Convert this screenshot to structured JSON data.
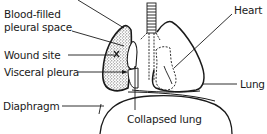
{
  "diagram": {
    "labels": {
      "blood_filled_line1": "Blood-filled",
      "blood_filled_line2": "pleural space",
      "wound_site": "Wound site",
      "visceral_pleura": "Visceral pleura",
      "diaphragm": "Diaphragm",
      "heart": "Heart",
      "lung": "Lung",
      "collapsed_lung": "Collapsed lung"
    },
    "colors": {
      "ink": "#1a1a1a",
      "background": "#ffffff",
      "stipple": "#555555"
    }
  }
}
